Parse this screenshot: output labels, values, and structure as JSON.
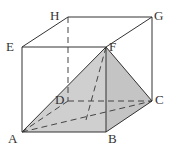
{
  "diagram": {
    "type": "cube-pyramid",
    "vertices": {
      "A": {
        "label": "A",
        "x": 22,
        "y": 132
      },
      "B": {
        "label": "B",
        "x": 106,
        "y": 132
      },
      "C": {
        "label": "C",
        "x": 152,
        "y": 101
      },
      "D": {
        "label": "D",
        "x": 68,
        "y": 101
      },
      "E": {
        "label": "E",
        "x": 22,
        "y": 47
      },
      "F": {
        "label": "F",
        "x": 106,
        "y": 47
      },
      "G": {
        "label": "G",
        "x": 152,
        "y": 17
      },
      "H": {
        "label": "H",
        "x": 68,
        "y": 17
      }
    },
    "shaded_faces": [
      [
        "A",
        "B",
        "F"
      ],
      [
        "B",
        "C",
        "F"
      ],
      [
        "A",
        "B",
        "C"
      ]
    ],
    "hidden_edges": [
      [
        "H",
        "D"
      ],
      [
        "D",
        "A"
      ],
      [
        "D",
        "C"
      ],
      [
        "A",
        "C"
      ],
      [
        "F",
        "D"
      ]
    ],
    "colors": {
      "edge": "#333333",
      "shade": "#c8c8c8"
    }
  }
}
